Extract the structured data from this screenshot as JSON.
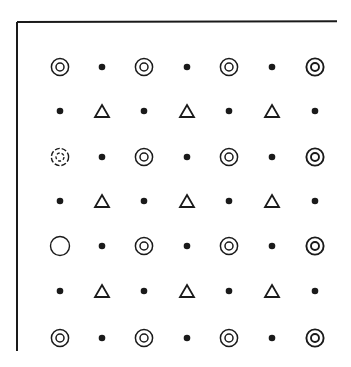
{
  "figure": {
    "ink_color": "#1a1a1a",
    "background": "#ffffff",
    "frame": {
      "top_line": {
        "x1": 17,
        "y1": 22,
        "x2": 337,
        "y2": 21
      },
      "left_line": {
        "x1": 17,
        "y1": 22,
        "x2": 17,
        "y2": 351
      }
    },
    "columns_x": [
      60,
      102,
      144,
      187,
      229,
      272,
      315
    ],
    "rows_y": [
      67,
      111,
      157,
      201,
      246,
      291,
      338
    ],
    "legend_of_symbols": {
      "C": "concentric-circle",
      "c": "dashed-concentric-circle",
      "O": "open-circle",
      "d": "filled-dot",
      "T": "open-triangle"
    },
    "grid": [
      [
        "C",
        "d",
        "C",
        "d",
        "C",
        "d",
        "C"
      ],
      [
        "d",
        "T",
        "d",
        "T",
        "d",
        "T",
        "d"
      ],
      [
        "c",
        "d",
        "C",
        "d",
        "C",
        "d",
        "C"
      ],
      [
        "d",
        "T",
        "d",
        "T",
        "d",
        "T",
        "d"
      ],
      [
        "O",
        "d",
        "C",
        "d",
        "C",
        "d",
        "C"
      ],
      [
        "d",
        "T",
        "d",
        "T",
        "d",
        "T",
        "d"
      ],
      [
        "C",
        "d",
        "C",
        "d",
        "C",
        "d",
        "C"
      ]
    ]
  }
}
